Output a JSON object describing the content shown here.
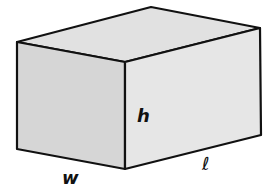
{
  "diagram": {
    "labels": {
      "height": "h",
      "width": "w",
      "length": "ℓ"
    },
    "colors": {
      "front_face": "#d6d6d6",
      "top_face": "#e1e1e1",
      "right_face": "#e6e6e6",
      "edge": "#111111",
      "background": "#ffffff"
    }
  }
}
